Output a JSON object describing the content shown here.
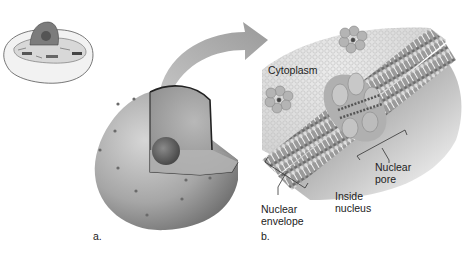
{
  "figure": {
    "panel_a": {
      "label": "a.",
      "thumbnail": "animal-cell-thumbnail",
      "subject": "nucleus-cutaway"
    },
    "panel_b": {
      "label": "b.",
      "labels": {
        "cytoplasm": "Cytoplasm",
        "nuclear_pore_1": "Nuclear",
        "nuclear_pore_2": "pore",
        "inside_nucleus_1": "Inside",
        "inside_nucleus_2": "nucleus",
        "nuclear_envelope_1": "Nuclear",
        "nuclear_envelope_2": "envelope"
      }
    },
    "arrow": "zoom-arrow"
  },
  "colors": {
    "text": "#222222",
    "arrow": "#a8a8a8",
    "nucleus": "#9a9a9a",
    "membrane": "#8c8c8c"
  }
}
